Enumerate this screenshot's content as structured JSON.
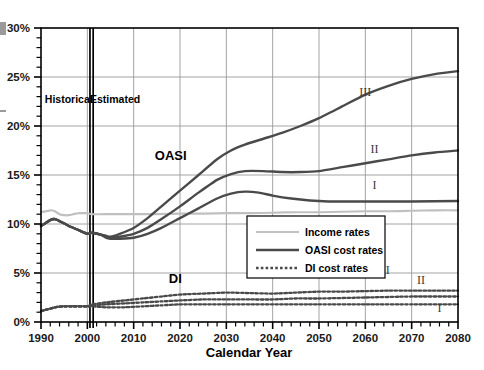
{
  "chart_data": {
    "type": "line",
    "title": "",
    "xlabel": "Calendar Year",
    "ylabel": "",
    "xlim": [
      1990,
      2080
    ],
    "ylim": [
      0,
      30
    ],
    "grid": true,
    "legend_position": "center-right-lower",
    "x_ticks": [
      1990,
      2000,
      2010,
      2020,
      2030,
      2040,
      2050,
      2060,
      2070,
      2080
    ],
    "x_tick_labels": [
      "1990",
      "2000",
      "2010",
      "2020",
      "2030",
      "2040",
      "2050",
      "2060",
      "2070",
      "2080"
    ],
    "x_minor_tick_step": 2,
    "y_ticks": [
      0,
      5,
      10,
      15,
      20,
      25,
      30
    ],
    "y_tick_labels": [
      "0%",
      "5%",
      "10%",
      "15%",
      "20%",
      "25%",
      "30%"
    ],
    "y_minor_tick_step": 1,
    "annotations": [
      {
        "name": "historical-label",
        "text": "Historical",
        "x": 1996,
        "y": 22.3
      },
      {
        "name": "estimated-label",
        "text": "Estimated",
        "x": 2006,
        "y": 22.3
      },
      {
        "name": "oasi-group-label",
        "text": "OASI",
        "x": 2018,
        "y": 16.5
      },
      {
        "name": "di-group-label",
        "text": "DI",
        "x": 2019,
        "y": 4.0
      },
      {
        "name": "oasi-III-label",
        "text": "III",
        "x": 2060,
        "y": 23.1
      },
      {
        "name": "oasi-II-label",
        "text": "II",
        "x": 2062,
        "y": 17.2
      },
      {
        "name": "oasi-I-label",
        "text": "I",
        "x": 2062,
        "y": 13.6
      },
      {
        "name": "di-III-label",
        "text": "III",
        "x": 2064,
        "y": 4.9
      },
      {
        "name": "di-II-label",
        "text": "II",
        "x": 2072,
        "y": 3.9
      },
      {
        "name": "di-I-label",
        "text": "I",
        "x": 2076,
        "y": 1.0
      }
    ],
    "divider": {
      "name": "historical-estimated-divider",
      "x": 2001,
      "style": "double-vertical-line"
    },
    "legend": [
      {
        "label": "Income rates",
        "style": "solid",
        "color": "#c0c0c0",
        "width": 2.2
      },
      {
        "label": "OASI cost rates",
        "style": "solid",
        "color": "#4a4a4a",
        "width": 2.6
      },
      {
        "label": "DI cost rates",
        "style": "dotted",
        "color": "#4a4a4a",
        "width": 2.6
      }
    ],
    "series": [
      {
        "name": "Income rates",
        "group": "income",
        "style": "solid",
        "color": "#c0c0c0",
        "x": [
          1990,
          1992,
          1993,
          1994,
          1995,
          1996,
          1997,
          1998,
          1999,
          2000,
          2001,
          2005,
          2010,
          2015,
          2020,
          2025,
          2030,
          2035,
          2040,
          2045,
          2050,
          2055,
          2060,
          2065,
          2070,
          2075,
          2080
        ],
        "values": [
          11.2,
          11.4,
          11.3,
          11.0,
          10.9,
          10.9,
          11.0,
          11.1,
          11.1,
          11.1,
          11.0,
          11.0,
          11.0,
          11.0,
          11.05,
          11.05,
          11.1,
          11.1,
          11.15,
          11.2,
          11.2,
          11.25,
          11.3,
          11.3,
          11.35,
          11.4,
          11.4
        ]
      },
      {
        "name": "OASI cost rate I (low cost)",
        "group": "oasi",
        "variant": "I",
        "style": "solid",
        "color": "#4a4a4a",
        "x": [
          1990,
          1992,
          1993,
          1994,
          1996,
          1998,
          2000,
          2001,
          2003,
          2004,
          2005,
          2007,
          2010,
          2013,
          2016,
          2020,
          2024,
          2028,
          2031,
          2034,
          2037,
          2040,
          2044,
          2048,
          2052,
          2056,
          2060,
          2070,
          2080
        ],
        "values": [
          9.8,
          10.4,
          10.5,
          10.3,
          9.8,
          9.4,
          9.0,
          9.1,
          8.9,
          8.6,
          8.5,
          8.5,
          8.6,
          9.0,
          9.6,
          10.6,
          11.6,
          12.6,
          13.1,
          13.3,
          13.2,
          12.9,
          12.6,
          12.4,
          12.3,
          12.3,
          12.3,
          12.3,
          12.35
        ]
      },
      {
        "name": "OASI cost rate II (intermediate)",
        "group": "oasi",
        "variant": "II",
        "style": "solid",
        "color": "#4a4a4a",
        "x": [
          1990,
          1992,
          1993,
          1994,
          1996,
          1998,
          2000,
          2001,
          2003,
          2004,
          2005,
          2007,
          2010,
          2013,
          2016,
          2020,
          2024,
          2028,
          2031,
          2034,
          2038,
          2042,
          2046,
          2050,
          2055,
          2060,
          2065,
          2070,
          2075,
          2080
        ],
        "values": [
          9.8,
          10.4,
          10.5,
          10.3,
          9.8,
          9.4,
          9.0,
          9.1,
          8.9,
          8.7,
          8.6,
          8.7,
          9.0,
          9.6,
          10.5,
          11.8,
          13.2,
          14.5,
          15.1,
          15.4,
          15.4,
          15.3,
          15.3,
          15.4,
          15.8,
          16.2,
          16.6,
          17.0,
          17.3,
          17.5
        ]
      },
      {
        "name": "OASI cost rate III (high cost)",
        "group": "oasi",
        "variant": "III",
        "style": "solid",
        "color": "#4a4a4a",
        "x": [
          1990,
          1992,
          1993,
          1994,
          1996,
          1998,
          2000,
          2001,
          2003,
          2004,
          2005,
          2007,
          2010,
          2013,
          2016,
          2020,
          2024,
          2028,
          2031,
          2034,
          2038,
          2042,
          2046,
          2050,
          2055,
          2060,
          2065,
          2070,
          2075,
          2080
        ],
        "values": [
          9.8,
          10.4,
          10.5,
          10.3,
          9.8,
          9.4,
          9.0,
          9.1,
          8.9,
          8.8,
          8.7,
          9.0,
          9.6,
          10.6,
          11.8,
          13.4,
          15.0,
          16.6,
          17.5,
          18.1,
          18.7,
          19.3,
          20.0,
          20.8,
          22.0,
          23.2,
          24.1,
          24.8,
          25.3,
          25.6
        ]
      },
      {
        "name": "DI cost rate I (low cost)",
        "group": "di",
        "variant": "I",
        "style": "dotted",
        "color": "#4a4a4a",
        "x": [
          1990,
          1993,
          1995,
          1997,
          2000,
          2001,
          2004,
          2008,
          2012,
          2016,
          2020,
          2025,
          2030,
          2035,
          2040,
          2050,
          2060,
          2070,
          2080
        ],
        "values": [
          1.1,
          1.5,
          1.6,
          1.6,
          1.6,
          1.6,
          1.5,
          1.5,
          1.6,
          1.7,
          1.8,
          1.8,
          1.8,
          1.8,
          1.8,
          1.8,
          1.8,
          1.8,
          1.8
        ]
      },
      {
        "name": "DI cost rate II (intermediate)",
        "group": "di",
        "variant": "II",
        "style": "dotted",
        "color": "#4a4a4a",
        "x": [
          1990,
          1993,
          1995,
          1997,
          2000,
          2001,
          2004,
          2008,
          2012,
          2016,
          2020,
          2025,
          2030,
          2035,
          2040,
          2045,
          2050,
          2060,
          2070,
          2080
        ],
        "values": [
          1.1,
          1.5,
          1.6,
          1.6,
          1.6,
          1.7,
          1.8,
          1.9,
          2.0,
          2.1,
          2.2,
          2.3,
          2.3,
          2.3,
          2.3,
          2.4,
          2.4,
          2.5,
          2.6,
          2.6
        ]
      },
      {
        "name": "DI cost rate III (high cost)",
        "group": "di",
        "variant": "III",
        "style": "dotted",
        "color": "#4a4a4a",
        "x": [
          1990,
          1993,
          1995,
          1997,
          2000,
          2001,
          2004,
          2008,
          2012,
          2016,
          2020,
          2025,
          2030,
          2035,
          2040,
          2045,
          2050,
          2055,
          2060,
          2065,
          2070,
          2075,
          2080
        ],
        "values": [
          1.1,
          1.5,
          1.6,
          1.6,
          1.6,
          1.8,
          2.0,
          2.2,
          2.4,
          2.6,
          2.8,
          2.9,
          3.0,
          2.95,
          2.9,
          3.0,
          3.1,
          3.1,
          3.15,
          3.2,
          3.2,
          3.2,
          3.2
        ]
      }
    ]
  },
  "colors": {
    "income": "#c0c0c0",
    "cost": "#4a4a4a",
    "grid": "#9a9a9a",
    "axis": "#000000",
    "background": "#ffffff"
  }
}
